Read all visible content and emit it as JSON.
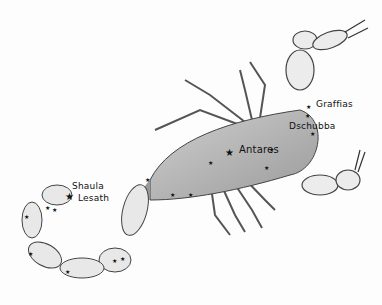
{
  "illustration": {
    "subject": "Scorpius constellation drawn as a scorpion",
    "stars": [
      {
        "name": "Graffias",
        "x": 313,
        "y": 107
      },
      {
        "name": "Dschubba",
        "x": 289,
        "y": 125
      },
      {
        "name": "Antares",
        "x": 229,
        "y": 152
      },
      {
        "name": "Shaula",
        "x": 69,
        "y": 195
      },
      {
        "name": "Lesath",
        "x": 66,
        "y": 198
      }
    ],
    "colors": {
      "ink": "#1a1a1a",
      "shade": "#8a8a8a",
      "paper": "#fdfdfd"
    }
  }
}
